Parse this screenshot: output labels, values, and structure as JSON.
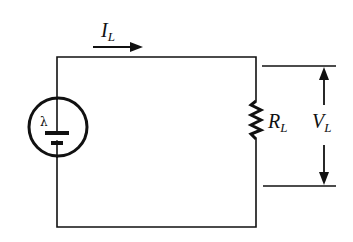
{
  "diagram": {
    "type": "circuit",
    "colors": {
      "stroke": "#111111",
      "background": "#ffffff"
    },
    "labels": {
      "current": {
        "main": "I",
        "sub": "L"
      },
      "resistor": {
        "main": "R",
        "sub": "L"
      },
      "voltage": {
        "main": "V",
        "sub": "L"
      },
      "source_symbol": "λ"
    },
    "components": [
      {
        "id": "photovoltaic-source",
        "symbol": "circle-with-battery",
        "marker": "λ"
      },
      {
        "id": "load-resistor",
        "symbol": "zigzag-resistor",
        "label": "R_L"
      },
      {
        "id": "current-arrow",
        "direction": "right",
        "label": "I_L"
      },
      {
        "id": "voltage-indicator",
        "direction": "bidirectional-vertical",
        "label": "V_L"
      }
    ]
  }
}
